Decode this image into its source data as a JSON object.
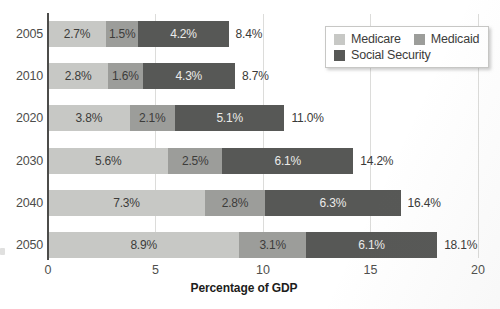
{
  "chart_data": {
    "type": "bar",
    "orientation": "horizontal",
    "stacked": true,
    "title": "",
    "xlabel": "Percentage of GDP",
    "xlim": [
      0,
      20
    ],
    "xticks": [
      0,
      5,
      10,
      15,
      20
    ],
    "xtick_labels": [
      "0",
      "5",
      "10",
      "15",
      "20"
    ],
    "grid": true,
    "legend_position": "top-right",
    "categories": [
      "2005",
      "2010",
      "2020",
      "2030",
      "2040",
      "2050"
    ],
    "series": [
      {
        "name": "Medicare",
        "color": "#c7c8c5",
        "label_color": "#3c3c3a",
        "values": [
          2.7,
          2.8,
          3.8,
          5.6,
          7.3,
          8.9
        ],
        "labels": [
          "2.7%",
          "2.8%",
          "3.8%",
          "5.6%",
          "7.3%",
          "8.9%"
        ]
      },
      {
        "name": "Medicaid",
        "color": "#9c9d9a",
        "label_color": "#3c3c3a",
        "values": [
          1.5,
          1.6,
          2.1,
          2.5,
          2.8,
          3.1
        ],
        "labels": [
          "1.5%",
          "1.6%",
          "2.1%",
          "2.5%",
          "2.8%",
          "3.1%"
        ]
      },
      {
        "name": "Social Security",
        "color": "#575856",
        "label_color": "#ebebe9",
        "values": [
          4.2,
          4.3,
          5.1,
          6.1,
          6.3,
          6.1
        ],
        "labels": [
          "4.2%",
          "4.3%",
          "5.1%",
          "6.1%",
          "6.3%",
          "6.1%"
        ]
      }
    ],
    "totals": [
      "8.4%",
      "8.7%",
      "11.0%",
      "14.2%",
      "16.4%",
      "18.1%"
    ],
    "axis_color": "#4c4c4a",
    "gridline_color": "#dcdcda"
  }
}
